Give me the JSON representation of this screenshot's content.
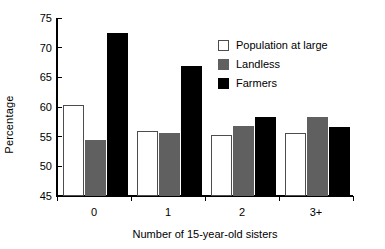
{
  "chart_data": {
    "type": "bar",
    "title": "",
    "xlabel": "Number of 15-year-old sisters",
    "ylabel": "Percentage",
    "categories": [
      "0",
      "1",
      "2",
      "3+"
    ],
    "ylim": [
      45,
      75
    ],
    "ytick_labels": [
      "45",
      "50",
      "55",
      "60",
      "65",
      "70",
      "75"
    ],
    "ytick_values": [
      45,
      50,
      55,
      60,
      65,
      70,
      75
    ],
    "grid": false,
    "legend_position": "upper right",
    "series": [
      {
        "name": "Population at large",
        "color": "#ffffff",
        "values": [
          60.3,
          56.0,
          55.3,
          55.7
        ]
      },
      {
        "name": "Landless",
        "color": "#606060",
        "values": [
          54.4,
          55.7,
          56.8,
          58.3
        ]
      },
      {
        "name": "Farmers",
        "color": "#000000",
        "values": [
          72.4,
          66.9,
          58.3,
          56.7
        ]
      }
    ]
  }
}
